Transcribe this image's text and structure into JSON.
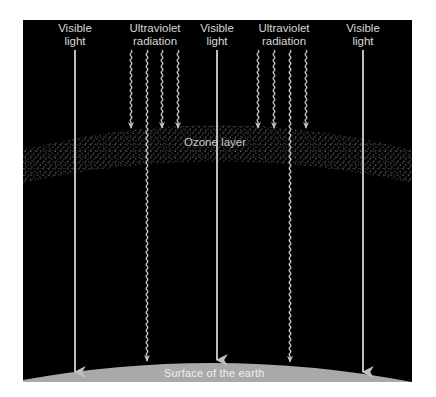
{
  "diagram": {
    "colors": {
      "background": "#000000",
      "page": "#ffffff",
      "arrow": "#b8b8b8",
      "text": "#d8d8d8",
      "surface": "#a9a9a9",
      "ozone_dots": "#9a9a9a"
    },
    "labels": {
      "visible_1": {
        "line1": "Visible",
        "line2": "light"
      },
      "uv_1": {
        "line1": "Ultraviolet",
        "line2": "radiation"
      },
      "visible_2": {
        "line1": "Visible",
        "line2": "light"
      },
      "uv_2": {
        "line1": "Ultraviolet",
        "line2": "radiation"
      },
      "visible_3": {
        "line1": "Visible",
        "line2": "light"
      },
      "ozone": "Ozone layer",
      "surface": "Surface of the earth"
    },
    "rays": [
      {
        "type": "visible",
        "x": 75,
        "reaches_surface": true
      },
      {
        "type": "uv",
        "x": 131,
        "reaches_surface": false
      },
      {
        "type": "uv",
        "x": 147,
        "reaches_surface": true
      },
      {
        "type": "uv",
        "x": 162,
        "reaches_surface": false
      },
      {
        "type": "uv",
        "x": 178,
        "reaches_surface": false
      },
      {
        "type": "visible",
        "x": 217,
        "reaches_surface": true
      },
      {
        "type": "uv",
        "x": 258,
        "reaches_surface": false
      },
      {
        "type": "uv",
        "x": 274,
        "reaches_surface": false
      },
      {
        "type": "uv",
        "x": 290,
        "reaches_surface": true
      },
      {
        "type": "uv",
        "x": 306,
        "reaches_surface": false
      },
      {
        "type": "visible",
        "x": 363,
        "reaches_surface": true
      }
    ]
  }
}
